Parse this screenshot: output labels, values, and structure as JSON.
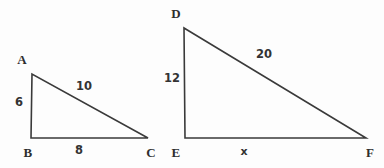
{
  "figure": {
    "stroke_color": "#3a3a3a",
    "background_color": "#fdfdfd",
    "label_color": "#2e2e2e",
    "stroke_width": 1.6,
    "width": 384,
    "height": 168
  },
  "triangles": [
    {
      "name": "triangle-abc",
      "vertices": [
        {
          "name": "A",
          "label": "A",
          "x": 32,
          "y": 74,
          "label_x": 22,
          "label_y": 59
        },
        {
          "name": "B",
          "label": "B",
          "x": 31,
          "y": 138,
          "label_x": 28,
          "label_y": 152
        },
        {
          "name": "C",
          "label": "C",
          "x": 148,
          "y": 138,
          "label_x": 151,
          "label_y": 152
        }
      ],
      "sides": [
        {
          "name": "side-ab",
          "label": "6",
          "x": 19,
          "y": 103
        },
        {
          "name": "side-ac",
          "label": "10",
          "x": 84,
          "y": 87
        },
        {
          "name": "side-bc",
          "label": "8",
          "x": 79,
          "y": 151
        }
      ]
    },
    {
      "name": "triangle-def",
      "vertices": [
        {
          "name": "D",
          "label": "D",
          "x": 184,
          "y": 28,
          "label_x": 176,
          "label_y": 13
        },
        {
          "name": "E",
          "label": "E",
          "x": 185,
          "y": 138,
          "label_x": 176,
          "label_y": 152
        },
        {
          "name": "F",
          "label": "F",
          "x": 366,
          "y": 138,
          "label_x": 370,
          "label_y": 152
        }
      ],
      "sides": [
        {
          "name": "side-de",
          "label": "12",
          "x": 172,
          "y": 79
        },
        {
          "name": "side-df",
          "label": "20",
          "x": 264,
          "y": 55
        },
        {
          "name": "side-ef",
          "label": "x",
          "x": 244,
          "y": 151
        }
      ]
    }
  ],
  "chart_data": {
    "type": "diagram",
    "shapes": [
      {
        "id": "ABC",
        "kind": "right-triangle",
        "vertex_labels": [
          "A",
          "B",
          "C"
        ],
        "right_angle_at": "B",
        "side_labels": {
          "AB": "6",
          "AC": "10",
          "BC": "8"
        },
        "side_values": {
          "AB": 6,
          "AC": 10,
          "BC": 8
        },
        "points": {
          "A": [
            32,
            74
          ],
          "B": [
            31,
            138
          ],
          "C": [
            148,
            138
          ]
        }
      },
      {
        "id": "DEF",
        "kind": "right-triangle",
        "vertex_labels": [
          "D",
          "E",
          "F"
        ],
        "right_angle_at": "E",
        "side_labels": {
          "DE": "12",
          "DF": "20",
          "EF": "x"
        },
        "side_values": {
          "DE": 12,
          "DF": 20,
          "EF": null
        },
        "points": {
          "D": [
            184,
            28
          ],
          "E": [
            185,
            138
          ],
          "F": [
            366,
            138
          ]
        }
      }
    ],
    "unknown": "x",
    "grid": false,
    "legend": null
  }
}
